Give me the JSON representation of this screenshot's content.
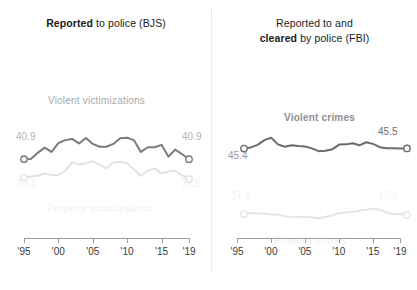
{
  "panels": [
    {
      "id": "bjs",
      "title_prefix": "Reported",
      "title_rest": " to police (BJS)",
      "series_labels": {
        "violent": "Violent victimizations",
        "property": "Property victimizations"
      },
      "endpoints": {
        "violent_start": "40.9",
        "violent_end": "40.9",
        "property_start": "33.1",
        "property_end": "32.5"
      }
    },
    {
      "id": "fbi",
      "title_line1": "Reported to and",
      "title_prefix": "cleared",
      "title_rest": " by police (FBI)",
      "series_labels": {
        "violent": "Violent crimes",
        "property": "Property crimes"
      },
      "endpoints": {
        "violent_start": "45.4",
        "violent_end": "45.5",
        "property_start": "17.6",
        "property_end": "17.2"
      }
    }
  ],
  "axis": {
    "ticks": [
      "'95",
      "'00",
      "'05",
      "'10",
      "'15",
      "'19"
    ],
    "tick_years": [
      1995,
      2000,
      2005,
      2010,
      2015,
      2019
    ]
  },
  "colors": {
    "violent_bjs": "#7b7b7b",
    "property_bjs": "#e2e2e2",
    "violent_fbi": "#6b6b6b",
    "property_fbi": "#e6e6e6",
    "axis": "#9d9d9d",
    "divider": "#d8d8d8",
    "title": "#1b1b1b"
  },
  "chart_data": {
    "type": "line",
    "xlabel": "",
    "ylabel": "Percent",
    "xlim": [
      1995,
      2019
    ],
    "ylim": [
      0,
      55
    ],
    "grid": false,
    "legend": "inline-labels",
    "panels": [
      {
        "name": "Reported to police (BJS)",
        "x": [
          1995,
          1996,
          1997,
          1998,
          1999,
          2000,
          2001,
          2002,
          2003,
          2004,
          2005,
          2006,
          2007,
          2008,
          2009,
          2010,
          2011,
          2012,
          2013,
          2014,
          2015,
          2016,
          2017,
          2018,
          2019
        ],
        "series": [
          {
            "name": "Violent victimizations",
            "color": "#7b7b7b",
            "values": [
              40.9,
              41.0,
              43.6,
              45.8,
              44.0,
              47.7,
              49.0,
              49.5,
              47.6,
              49.9,
              47.4,
              46.2,
              46.2,
              47.4,
              49.8,
              50.0,
              49.0,
              44.0,
              46.0,
              46.0,
              47.0,
              42.0,
              45.0,
              43.0,
              40.9
            ],
            "endpoint_labels": {
              "start": "40.9",
              "end": "40.9"
            }
          },
          {
            "name": "Property victimizations",
            "color": "#e2e2e2",
            "values": [
              33.1,
              33.6,
              33.9,
              34.9,
              34.2,
              34.2,
              36.0,
              39.5,
              38.7,
              39.2,
              40.0,
              38.5,
              37.0,
              39.5,
              39.8,
              39.3,
              36.5,
              33.8,
              36.0,
              37.0,
              34.8,
              35.7,
              36.0,
              34.0,
              32.5
            ],
            "endpoint_labels": {
              "start": "33.1",
              "end": "32.5"
            }
          }
        ]
      },
      {
        "name": "Reported to and cleared by police (FBI)",
        "x": [
          1995,
          1996,
          1997,
          1998,
          1999,
          2000,
          2001,
          2002,
          2003,
          2004,
          2005,
          2006,
          2007,
          2008,
          2009,
          2010,
          2011,
          2012,
          2013,
          2014,
          2015,
          2016,
          2017,
          2018,
          2019
        ],
        "series": [
          {
            "name": "Violent crimes",
            "color": "#6b6b6b",
            "values": [
              45.4,
              45.9,
              47.0,
              49.0,
              50.0,
              47.2,
              46.2,
              46.8,
              46.5,
              46.3,
              45.5,
              44.3,
              44.5,
              45.1,
              47.1,
              47.2,
              47.7,
              46.8,
              48.1,
              47.4,
              46.0,
              45.6,
              45.6,
              45.5,
              45.5
            ],
            "endpoint_labels": {
              "start": "45.4",
              "end": "45.5"
            }
          },
          {
            "name": "Property crimes",
            "color": "#e6e6e6",
            "values": [
              17.6,
              18.0,
              18.0,
              17.8,
              17.4,
              17.3,
              16.7,
              16.5,
              16.4,
              16.5,
              16.3,
              15.8,
              16.5,
              17.0,
              18.0,
              18.3,
              18.6,
              19.0,
              19.4,
              20.0,
              19.4,
              18.3,
              17.5,
              17.6,
              17.2
            ],
            "endpoint_labels": {
              "start": "17.6",
              "end": "17.2"
            }
          }
        ]
      }
    ]
  }
}
